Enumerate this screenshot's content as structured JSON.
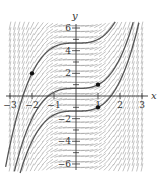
{
  "chart_data": {
    "type": "line",
    "subtype": "slope_field_with_solution_curves",
    "title": "",
    "xlabel": "x",
    "ylabel": "y",
    "xlim": [
      -3,
      3
    ],
    "ylim": [
      -6.3,
      6.3
    ],
    "grid": false,
    "legend": null,
    "x_ticks": [
      -3,
      -2,
      -1,
      1,
      2,
      3
    ],
    "x_tick_labels": [
      "−3",
      "−2",
      "−1",
      "1",
      "2",
      "3"
    ],
    "y_ticks": [
      6,
      4,
      2,
      -2,
      -4,
      -6
    ],
    "y_tick_labels": [
      "6",
      "4",
      "2",
      "−2",
      "−4",
      "−6"
    ],
    "y_minor_ticks": [
      5,
      3,
      1,
      -1,
      -3,
      -5
    ],
    "slope_field": {
      "equation": "dy/dx = x^2",
      "x_step": 0.2,
      "y_step": 0.5,
      "color": "#9a9a9a"
    },
    "series": [
      {
        "name": "curve through (-2, 2)",
        "formula": "y = x^3/3 + 14/3",
        "C": 4.667
      },
      {
        "name": "curve through (1, 1)",
        "formula": "y = x^3/3 + 2/3",
        "C": 0.667
      },
      {
        "name": "curve through (1, -1)",
        "formula": "y = x^3/3 - 4/3",
        "C": -1.333
      }
    ],
    "points": [
      {
        "x": -2,
        "y": 2
      },
      {
        "x": 1,
        "y": 1
      },
      {
        "x": 1,
        "y": -1
      }
    ],
    "curve_color": "#555555"
  }
}
